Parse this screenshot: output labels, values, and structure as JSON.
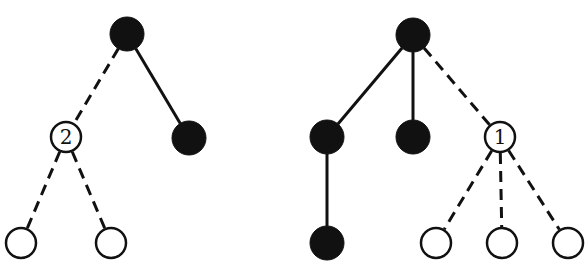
{
  "colors": {
    "filled": "#111111",
    "open": "#ffffff",
    "stroke": "#111111"
  },
  "trees": [
    {
      "name": "left-tree",
      "nodes": [
        {
          "id": "L0",
          "x": 127,
          "y": 34,
          "r": 17,
          "filled": true,
          "label": ""
        },
        {
          "id": "L1",
          "x": 66,
          "y": 137,
          "r": 16,
          "filled": false,
          "label": "2"
        },
        {
          "id": "L2",
          "x": 189,
          "y": 138,
          "r": 17,
          "filled": true,
          "label": ""
        },
        {
          "id": "L3",
          "x": 21,
          "y": 243,
          "r": 16,
          "filled": false,
          "label": ""
        },
        {
          "id": "L4",
          "x": 111,
          "y": 243,
          "r": 16,
          "filled": false,
          "label": ""
        }
      ],
      "edges": [
        {
          "from": "L0",
          "to": "L1",
          "style": "dashed"
        },
        {
          "from": "L0",
          "to": "L2",
          "style": "solid"
        },
        {
          "from": "L1",
          "to": "L3",
          "style": "dashed"
        },
        {
          "from": "L1",
          "to": "L4",
          "style": "dashed"
        }
      ]
    },
    {
      "name": "right-tree",
      "nodes": [
        {
          "id": "R0",
          "x": 413,
          "y": 35,
          "r": 17,
          "filled": true,
          "label": ""
        },
        {
          "id": "R1",
          "x": 327,
          "y": 137,
          "r": 17,
          "filled": true,
          "label": ""
        },
        {
          "id": "R2",
          "x": 413,
          "y": 137,
          "r": 17,
          "filled": true,
          "label": ""
        },
        {
          "id": "R3",
          "x": 500,
          "y": 137,
          "r": 16,
          "filled": false,
          "label": "1"
        },
        {
          "id": "R4",
          "x": 327,
          "y": 243,
          "r": 17,
          "filled": true,
          "label": ""
        },
        {
          "id": "R5",
          "x": 436,
          "y": 243,
          "r": 16,
          "filled": false,
          "label": ""
        },
        {
          "id": "R6",
          "x": 502,
          "y": 243,
          "r": 16,
          "filled": false,
          "label": ""
        },
        {
          "id": "R7",
          "x": 568,
          "y": 243,
          "r": 16,
          "filled": false,
          "label": ""
        }
      ],
      "edges": [
        {
          "from": "R0",
          "to": "R1",
          "style": "solid"
        },
        {
          "from": "R0",
          "to": "R2",
          "style": "solid"
        },
        {
          "from": "R0",
          "to": "R3",
          "style": "dashed"
        },
        {
          "from": "R1",
          "to": "R4",
          "style": "solid"
        },
        {
          "from": "R3",
          "to": "R5",
          "style": "dashed"
        },
        {
          "from": "R3",
          "to": "R6",
          "style": "dashed"
        },
        {
          "from": "R3",
          "to": "R7",
          "style": "dashed"
        }
      ]
    }
  ]
}
